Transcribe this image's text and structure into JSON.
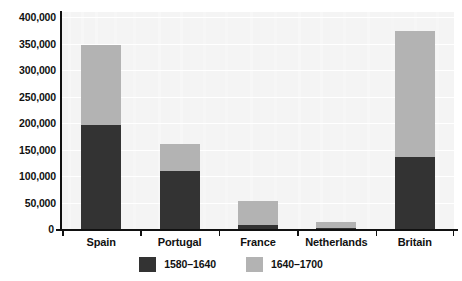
{
  "chart_data": {
    "type": "bar",
    "title": "",
    "subtitle": "",
    "xlabel": "",
    "ylabel": "",
    "stacked": true,
    "grid": true,
    "legend_position": "bottom",
    "ylim": [
      0,
      400000
    ],
    "ytick_labels": [
      "400,000",
      "350,000",
      "300,000",
      "250,000",
      "200,000",
      "150,000",
      "100,000",
      "50,000",
      "0"
    ],
    "ytick_values": [
      400000,
      350000,
      300000,
      250000,
      200000,
      150000,
      100000,
      50000,
      0
    ],
    "categories": [
      "Spain",
      "Portugal",
      "France",
      "Netherlands",
      "Britain"
    ],
    "series": [
      {
        "name": "1580–1640",
        "color": "#333333",
        "values": [
          197000,
          110000,
          7000,
          2000,
          136000
        ]
      },
      {
        "name": "1640–1700",
        "color": "#b3b3b3",
        "values": [
          150000,
          50000,
          45000,
          11000,
          237000
        ]
      }
    ],
    "totals": [
      347000,
      160000,
      52000,
      13000,
      373000
    ]
  },
  "legend": {
    "items": [
      {
        "label": "1580–1640",
        "color": "#333333"
      },
      {
        "label": "1640–1700",
        "color": "#b3b3b3"
      }
    ]
  },
  "colors": {
    "series_early": "#333333",
    "series_late": "#b3b3b3",
    "plot_background": "#f4f4f4",
    "gridline": "#ffffff",
    "axis": "#111111",
    "text": "#111111"
  }
}
